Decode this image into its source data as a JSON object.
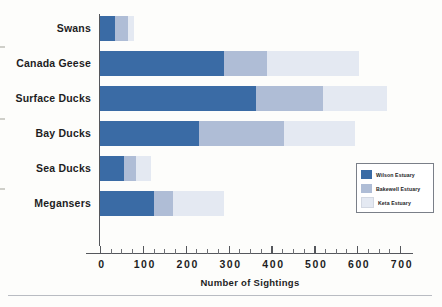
{
  "chart_data": {
    "type": "bar",
    "orientation": "horizontal",
    "stacked": true,
    "title": "",
    "xlabel": "Number of Sightings",
    "ylabel": "",
    "xlim": [
      0,
      700
    ],
    "ylim": null,
    "grid": false,
    "legend_position": "inside-right",
    "categories": [
      "Swans",
      "Canada Geese",
      "Surface Ducks",
      "Bay Ducks",
      "Sea Ducks",
      "Megansers"
    ],
    "series": [
      {
        "name": "Wilson Estuary",
        "color": "#3a6ba5",
        "values": [
          35,
          290,
          365,
          230,
          55,
          125
        ]
      },
      {
        "name": "Bakewell Estuary",
        "color": "#afbdd6",
        "values": [
          30,
          100,
          155,
          200,
          30,
          45
        ]
      },
      {
        "name": "Keta Estuary",
        "color": "#e4e9f2",
        "values": [
          15,
          215,
          150,
          165,
          35,
          120
        ]
      }
    ],
    "totals": [
      80,
      605,
      670,
      595,
      120,
      290
    ],
    "xticks": [
      0,
      100,
      200,
      300,
      400,
      500,
      600,
      700
    ],
    "xtick_labels": [
      "0",
      "100",
      "200",
      "300",
      "400",
      "500",
      "600",
      "700"
    ],
    "xtick_minor_step": 25
  },
  "axis": {
    "x_title": "Number of Sightings"
  },
  "legend": {
    "items": [
      {
        "label": "Wilson Estuary",
        "color": "#3a6ba5"
      },
      {
        "label": "Bakewell Estuary",
        "color": "#afbdd6"
      },
      {
        "label": "Keta Estuary",
        "color": "#e4e9f2"
      }
    ]
  }
}
